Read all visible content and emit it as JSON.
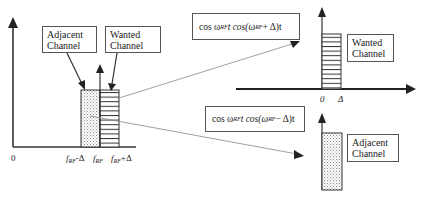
{
  "diagram": {
    "left_plot": {
      "origin_label": "0",
      "x_ticks": [
        {
          "id": "f_rf_minus_delta",
          "base": "f",
          "sub": "RF",
          "suffix": "-Δ"
        },
        {
          "id": "f_rf",
          "base": "f",
          "sub": "RF",
          "suffix": ""
        },
        {
          "id": "f_rf_plus_delta",
          "base": "f",
          "sub": "RF",
          "suffix": "+Δ"
        }
      ],
      "adjacent_label": {
        "line1": "Adjacent",
        "line2": "Channel"
      },
      "wanted_label": {
        "line1": "Wanted",
        "line2": "Channel"
      }
    },
    "upper_right": {
      "formula": {
        "pre": "cos ω",
        "sub1": "RF",
        "mid": " t cos(ω",
        "sub2": "RF",
        "post": " + Δ)t"
      },
      "x_ticks": [
        "0",
        "Δ"
      ],
      "wanted_label": {
        "line1": "Wanted",
        "line2": "Channel"
      }
    },
    "lower_right": {
      "formula": {
        "pre": "cos ω",
        "sub1": "RF",
        "mid": " t cos(ω",
        "sub2": "RF",
        "post": " − Δ)t"
      },
      "adjacent_label": {
        "line1": "Adjacent",
        "line2": "Channel"
      }
    },
    "colors": {
      "line": "#333333",
      "thin_line": "#777777",
      "dot_fill": "#bdbdbd",
      "background": "#ffffff"
    }
  }
}
